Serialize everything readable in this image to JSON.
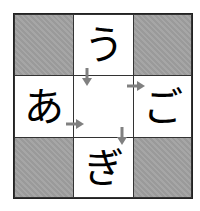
{
  "puzzle": {
    "cells": {
      "top": "う",
      "left": "あ",
      "right": "ご",
      "bottom": "ぎ",
      "center": ""
    },
    "colors": {
      "shaded": "#9e9e9e",
      "arrow": "#808080",
      "border": "#222222"
    },
    "arrows": [
      {
        "from": "top",
        "to": "center",
        "direction": "down"
      },
      {
        "from": "center",
        "to": "right",
        "direction": "right"
      },
      {
        "from": "left",
        "to": "center",
        "direction": "right"
      },
      {
        "from": "center",
        "to": "bottom",
        "direction": "down"
      }
    ]
  }
}
